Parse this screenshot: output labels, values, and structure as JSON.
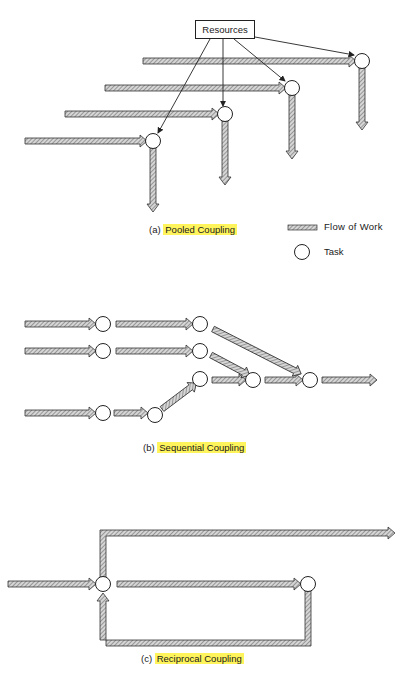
{
  "figure": {
    "pooled": {
      "prefix": "(a)",
      "title": "Pooled Coupling",
      "resources_label": "Resources"
    },
    "legend": {
      "flow_label": "Flow of Work",
      "task_label": "Task"
    },
    "sequential": {
      "prefix": "(b)",
      "title": "Sequential Coupling"
    },
    "reciprocal": {
      "prefix": "(c)",
      "title": "Reciprocal Coupling"
    },
    "colors": {
      "highlight": "#fff45c",
      "arrow_fill": "#b8b8b8",
      "stroke": "#333333"
    }
  }
}
